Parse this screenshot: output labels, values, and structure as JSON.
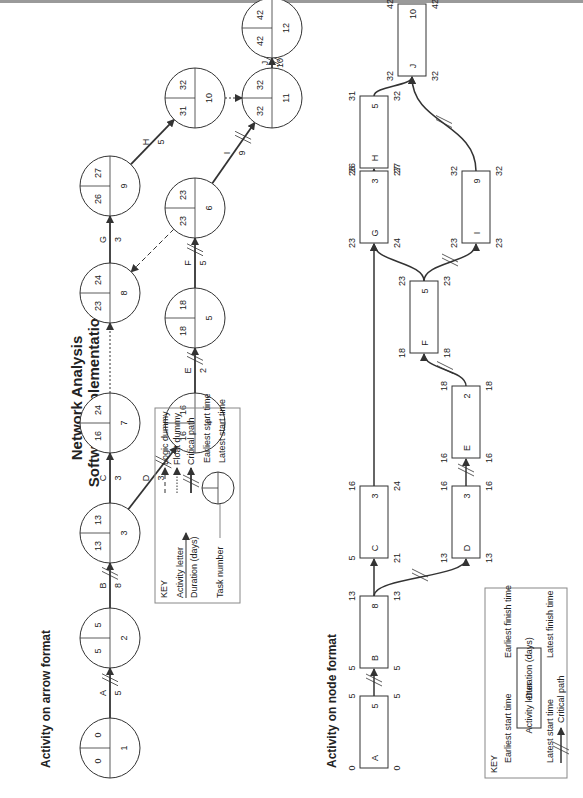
{
  "title": {
    "line1": "Network Analysis",
    "line2": "Software Implementation"
  },
  "aoa": {
    "heading": "Activity on arrow format",
    "nodes": [
      {
        "id": 1,
        "es": "0",
        "ls": "0"
      },
      {
        "id": 2,
        "es": "5",
        "ls": "5"
      },
      {
        "id": 3,
        "es": "13",
        "ls": "13"
      },
      {
        "id": 7,
        "es": "16",
        "ls": "24"
      },
      {
        "id": 8,
        "es": "23",
        "ls": "24"
      },
      {
        "id": 9,
        "es": "26",
        "ls": "27"
      },
      {
        "id": 4,
        "es": "16",
        "ls": "16"
      },
      {
        "id": 5,
        "es": "18",
        "ls": "18"
      },
      {
        "id": 6,
        "es": "23",
        "ls": "23"
      },
      {
        "id": 10,
        "es": "31",
        "ls": "32"
      },
      {
        "id": 11,
        "es": "32",
        "ls": "32"
      },
      {
        "id": 12,
        "es": "42",
        "ls": "42"
      }
    ],
    "activities": [
      {
        "letter": "A",
        "duration": "5",
        "from": 1,
        "to": 2,
        "critical": true
      },
      {
        "letter": "B",
        "duration": "8",
        "from": 2,
        "to": 3,
        "critical": true
      },
      {
        "letter": "C",
        "duration": "3",
        "from": 3,
        "to": 7,
        "critical": false
      },
      {
        "letter": "D",
        "duration": "3",
        "from": 3,
        "to": 4,
        "critical": true
      },
      {
        "letter": "E",
        "duration": "2",
        "from": 4,
        "to": 5,
        "critical": true
      },
      {
        "letter": "F",
        "duration": "5",
        "from": 5,
        "to": 6,
        "critical": true
      },
      {
        "letter": "G",
        "duration": "3",
        "from": 8,
        "to": 9,
        "critical": false
      },
      {
        "letter": "H",
        "duration": "5",
        "from": 9,
        "to": 10,
        "critical": false
      },
      {
        "letter": "I",
        "duration": "9",
        "from": 6,
        "to": 11,
        "critical": true
      },
      {
        "letter": "J",
        "duration": "10",
        "from": 11,
        "to": 12,
        "critical": true
      }
    ],
    "key": {
      "title": "KEY",
      "activity_letter": "Activity letter",
      "duration": "Duration (days)",
      "logic_dummy": "Logic dummy",
      "float_dummy": "Float dummy",
      "critical_path": "Critical path",
      "task_number": "Task number",
      "earliest_start": "Earliest start time",
      "latest_start": "Latest start time"
    }
  },
  "aon": {
    "heading": "Activity on node format",
    "nodes": [
      {
        "letter": "A",
        "duration": "5",
        "es": "0",
        "ef": "5",
        "ls": "0",
        "lf": "5"
      },
      {
        "letter": "B",
        "duration": "8",
        "es": "5",
        "ef": "13",
        "ls": "5",
        "lf": "13"
      },
      {
        "letter": "C",
        "duration": "3",
        "es": "5",
        "ef": "16",
        "ls": "21",
        "lf": "24"
      },
      {
        "letter": "D",
        "duration": "3",
        "es": "13",
        "ef": "16",
        "ls": "13",
        "lf": "16"
      },
      {
        "letter": "E",
        "duration": "2",
        "es": "16",
        "ef": "18",
        "ls": "16",
        "lf": "18"
      },
      {
        "letter": "F",
        "duration": "5",
        "es": "18",
        "ef": "23",
        "ls": "18",
        "lf": "23"
      },
      {
        "letter": "G",
        "duration": "3",
        "es": "23",
        "ef": "26",
        "ls": "24",
        "lf": "27"
      },
      {
        "letter": "H",
        "duration": "5",
        "es": "26",
        "ef": "31",
        "ls": "27",
        "lf": "32"
      },
      {
        "letter": "I",
        "duration": "9",
        "es": "23",
        "ef": "32",
        "ls": "23",
        "lf": "32"
      },
      {
        "letter": "J",
        "duration": "10",
        "es": "32",
        "ef": "42",
        "ls": "32",
        "lf": "42"
      }
    ],
    "key": {
      "title": "KEY",
      "earliest_start": "Earliest start time",
      "earliest_finish": "Earliest finish time",
      "latest_start": "Latest start time",
      "latest_finish": "Latest finish time",
      "activity_letter": "Activity letter",
      "duration": "Duration (days)",
      "critical_path": "Critical path"
    }
  },
  "colors": {
    "line": "#333333",
    "text": "#222222",
    "key_border": "#888888"
  }
}
